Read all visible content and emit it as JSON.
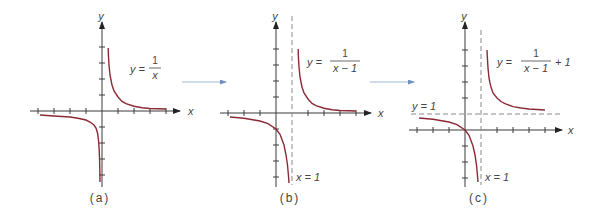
{
  "figure": {
    "panels": [
      {
        "id": "a",
        "caption": "(a)",
        "equation": {
          "lhs": "y =",
          "num": "1",
          "den": "x",
          "suffix": ""
        },
        "axis_labels": {
          "x": "x",
          "y": "y"
        },
        "function": "1/x",
        "h_shift": 0,
        "v_shift": 0,
        "asymptotes": [],
        "x_ticks": [
          -4,
          -3,
          -2,
          -1,
          1,
          2,
          3,
          4
        ],
        "y_ticks": [
          -4,
          -3,
          -2,
          -1,
          1,
          2,
          3,
          4
        ]
      },
      {
        "id": "b",
        "caption": "(b)",
        "equation": {
          "lhs": "y =",
          "num": "1",
          "den": "x − 1",
          "suffix": ""
        },
        "axis_labels": {
          "x": "x",
          "y": "y"
        },
        "function": "1/(x-1)",
        "h_shift": 1,
        "v_shift": 0,
        "asymptotes": [
          {
            "type": "vertical",
            "label": "x = 1"
          }
        ],
        "x_ticks": [
          -3,
          -2,
          -1,
          1,
          2,
          3,
          4,
          5
        ],
        "y_ticks": [
          -4,
          -3,
          -2,
          -1,
          1,
          2,
          3,
          4
        ]
      },
      {
        "id": "c",
        "caption": "(c)",
        "equation": {
          "lhs": "y =",
          "num": "1",
          "den": "x − 1",
          "suffix": "+ 1"
        },
        "axis_labels": {
          "x": "x",
          "y": "y"
        },
        "function": "1/(x-1)+1",
        "h_shift": 1,
        "v_shift": 1,
        "asymptotes": [
          {
            "type": "vertical",
            "label": "x = 1"
          },
          {
            "type": "horizontal",
            "label": "y = 1"
          }
        ],
        "x_ticks": [
          -3,
          -2,
          -1,
          1,
          2,
          3,
          4,
          5
        ],
        "y_ticks": [
          -3,
          -2,
          -1,
          1,
          2,
          3,
          4,
          5
        ]
      }
    ],
    "transitions": [
      "shift right 1",
      "shift up 1"
    ],
    "colors": {
      "curve": "#8b2a35",
      "axis": "#3a3a3a",
      "asymptote": "#8a8a8a",
      "arrow": "#9fb7d9"
    }
  }
}
